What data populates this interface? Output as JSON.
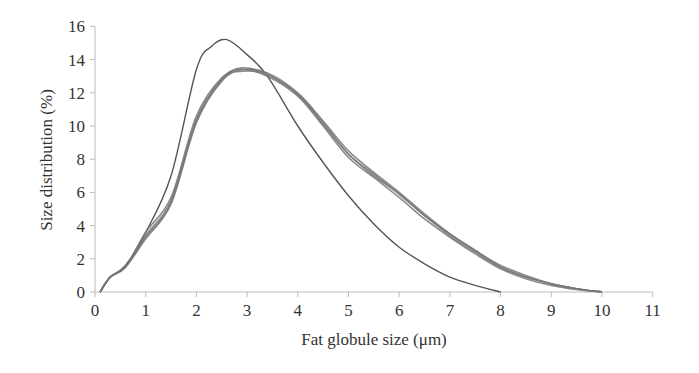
{
  "chart_data": {
    "type": "line",
    "title": "",
    "xlabel": "Fat globule size (μm)",
    "ylabel": "Size distribution (%)",
    "xlim": [
      0,
      11
    ],
    "ylim": [
      0,
      16
    ],
    "xticks": [
      0,
      1,
      2,
      3,
      4,
      5,
      6,
      7,
      8,
      9,
      10,
      11
    ],
    "yticks": [
      0,
      2,
      4,
      6,
      8,
      10,
      12,
      14,
      16
    ],
    "grid": false,
    "legend": null,
    "series": [
      {
        "name": "sample-narrow",
        "style": "thin",
        "x": [
          0.1,
          0.3,
          0.6,
          1.0,
          1.5,
          2.0,
          2.3,
          2.6,
          3.0,
          3.4,
          4.0,
          4.5,
          5.0,
          5.5,
          6.0,
          6.5,
          7.0,
          7.5,
          8.0
        ],
        "values": [
          0.0,
          0.9,
          1.6,
          3.6,
          7.0,
          13.4,
          14.8,
          15.2,
          14.3,
          13.0,
          10.0,
          7.8,
          5.8,
          4.1,
          2.7,
          1.7,
          0.9,
          0.4,
          0.0
        ]
      },
      {
        "name": "sample-a",
        "style": "band",
        "x": [
          0.1,
          0.3,
          0.6,
          1.0,
          1.5,
          2.0,
          2.5,
          2.9,
          3.4,
          4.0,
          4.5,
          5.0,
          5.5,
          6.0,
          6.5,
          7.0,
          7.5,
          8.0,
          8.5,
          9.0,
          9.5,
          10.0
        ],
        "values": [
          0.0,
          0.9,
          1.5,
          3.4,
          5.5,
          10.4,
          12.8,
          13.5,
          13.1,
          11.9,
          10.1,
          8.3,
          7.0,
          5.9,
          4.6,
          3.4,
          2.4,
          1.5,
          0.9,
          0.5,
          0.2,
          0.0
        ]
      },
      {
        "name": "sample-b",
        "style": "band",
        "x": [
          0.1,
          0.3,
          0.6,
          1.0,
          1.5,
          2.0,
          2.5,
          2.9,
          3.4,
          4.0,
          4.5,
          5.0,
          5.5,
          6.0,
          6.5,
          7.0,
          7.5,
          8.0,
          8.5,
          9.0,
          9.5,
          10.0
        ],
        "values": [
          0.0,
          0.9,
          1.5,
          3.2,
          5.3,
          10.2,
          12.7,
          13.4,
          13.2,
          12.0,
          10.3,
          8.5,
          7.2,
          6.0,
          4.7,
          3.5,
          2.5,
          1.6,
          1.0,
          0.5,
          0.2,
          0.0
        ]
      },
      {
        "name": "sample-c",
        "style": "band",
        "x": [
          0.1,
          0.3,
          0.6,
          1.0,
          1.5,
          2.0,
          2.5,
          2.9,
          3.4,
          4.0,
          4.5,
          5.0,
          5.5,
          6.0,
          6.5,
          7.0,
          7.5,
          8.0,
          8.5,
          9.0,
          9.5,
          10.0
        ],
        "values": [
          0.0,
          0.9,
          1.5,
          3.6,
          5.7,
          10.6,
          12.9,
          13.4,
          13.0,
          11.8,
          10.0,
          8.1,
          6.9,
          5.7,
          4.4,
          3.3,
          2.3,
          1.4,
          0.8,
          0.4,
          0.15,
          0.0
        ]
      },
      {
        "name": "sample-d",
        "style": "band",
        "x": [
          0.1,
          0.3,
          0.6,
          1.0,
          1.5,
          2.0,
          2.5,
          2.9,
          3.4,
          4.0,
          4.5,
          5.0,
          5.5,
          6.0,
          6.5,
          7.0,
          7.5,
          8.0,
          8.5,
          9.0,
          9.5,
          10.0
        ],
        "values": [
          0.0,
          0.9,
          1.5,
          3.3,
          5.4,
          10.3,
          12.8,
          13.3,
          13.1,
          11.9,
          10.2,
          8.3,
          7.1,
          5.9,
          4.6,
          3.5,
          2.5,
          1.5,
          0.9,
          0.5,
          0.2,
          0.0
        ]
      }
    ]
  },
  "colors": {
    "axis": "#bbbbbb",
    "tick_text": "#333333",
    "thin_line": "#555555",
    "band_line": "#777777"
  },
  "plot": {
    "x0_px": 95,
    "x_per_unit_px": 50.7,
    "y0_px": 292,
    "y_per_unit_px": 16.6
  }
}
